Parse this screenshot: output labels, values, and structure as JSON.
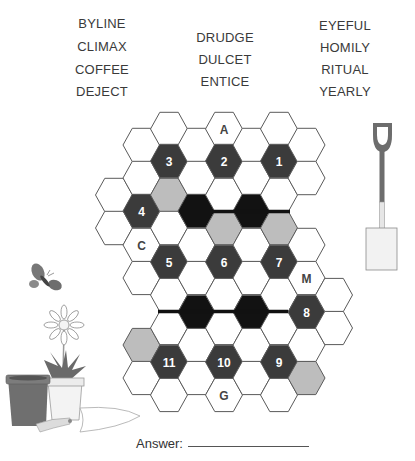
{
  "word_list": {
    "column_1": [
      "BYLINE",
      "CLIMAX",
      "COFFEE",
      "DEJECT"
    ],
    "column_2": [
      "DRUDGE",
      "DULCET",
      "ENTICE"
    ],
    "column_3": [
      "EYEFUL",
      "HOMILY",
      "RITUAL",
      "YEARLY"
    ]
  },
  "word_positions": {
    "column_1": {
      "x": 102,
      "y": [
        23,
        46,
        69,
        91
      ]
    },
    "column_2": {
      "x": 225,
      "y": [
        37,
        59,
        81
      ]
    },
    "column_3": {
      "x": 345,
      "y": [
        25,
        47,
        69,
        91
      ]
    }
  },
  "colors": {
    "numbered": "#3b3b3b",
    "blocked": "#121212",
    "shaded": "#bdbdbd",
    "empty": "#ffffff",
    "stroke": "#5a5a5a",
    "number_text": "#ffffff",
    "letter_text": "#444444"
  },
  "grid": {
    "column_x": [
      114,
      141.5,
      169,
      196.5,
      224,
      251.5,
      279,
      306.5,
      334
    ],
    "hex_radius": 18.5,
    "hex_height": 33.3,
    "cells": [
      {
        "c": 0,
        "y": 195,
        "type": "empty",
        "label": ""
      },
      {
        "c": 0,
        "y": 228,
        "type": "empty",
        "label": ""
      },
      {
        "c": 1,
        "y": 145,
        "type": "empty",
        "label": ""
      },
      {
        "c": 1,
        "y": 178,
        "type": "empty",
        "label": ""
      },
      {
        "c": 1,
        "y": 211,
        "type": "numbered",
        "label": "4"
      },
      {
        "c": 1,
        "y": 245,
        "type": "letter",
        "label": "C"
      },
      {
        "c": 1,
        "y": 278,
        "type": "empty",
        "label": ""
      },
      {
        "c": 1,
        "y": 345,
        "type": "shaded",
        "label": ""
      },
      {
        "c": 1,
        "y": 378,
        "type": "empty",
        "label": ""
      },
      {
        "c": 2,
        "y": 129,
        "type": "empty",
        "label": ""
      },
      {
        "c": 2,
        "y": 161,
        "type": "numbered",
        "label": "3"
      },
      {
        "c": 2,
        "y": 195,
        "type": "shaded",
        "label": ""
      },
      {
        "c": 2,
        "y": 228,
        "type": "empty",
        "label": ""
      },
      {
        "c": 2,
        "y": 262,
        "type": "numbered",
        "label": "5"
      },
      {
        "c": 2,
        "y": 295,
        "type": "empty",
        "label": ""
      },
      {
        "c": 2,
        "y": 328,
        "type": "empty",
        "label": ""
      },
      {
        "c": 2,
        "y": 362,
        "type": "numbered",
        "label": "11"
      },
      {
        "c": 2,
        "y": 395,
        "type": "empty",
        "label": ""
      },
      {
        "c": 3,
        "y": 145,
        "type": "empty",
        "label": ""
      },
      {
        "c": 3,
        "y": 178,
        "type": "empty",
        "label": ""
      },
      {
        "c": 3,
        "y": 211,
        "type": "blocked",
        "label": ""
      },
      {
        "c": 3,
        "y": 245,
        "type": "empty",
        "label": ""
      },
      {
        "c": 3,
        "y": 278,
        "type": "empty",
        "label": ""
      },
      {
        "c": 3,
        "y": 312,
        "type": "blocked",
        "label": ""
      },
      {
        "c": 3,
        "y": 345,
        "type": "empty",
        "label": ""
      },
      {
        "c": 3,
        "y": 378,
        "type": "empty",
        "label": ""
      },
      {
        "c": 4,
        "y": 129,
        "type": "letter",
        "label": "A"
      },
      {
        "c": 4,
        "y": 161,
        "type": "numbered",
        "label": "2"
      },
      {
        "c": 4,
        "y": 195,
        "type": "empty",
        "label": ""
      },
      {
        "c": 4,
        "y": 228,
        "type": "shaded",
        "label": ""
      },
      {
        "c": 4,
        "y": 262,
        "type": "numbered",
        "label": "6"
      },
      {
        "c": 4,
        "y": 295,
        "type": "empty",
        "label": ""
      },
      {
        "c": 4,
        "y": 328,
        "type": "empty",
        "label": ""
      },
      {
        "c": 4,
        "y": 362,
        "type": "numbered",
        "label": "10"
      },
      {
        "c": 4,
        "y": 395,
        "type": "letter",
        "label": "G"
      },
      {
        "c": 5,
        "y": 145,
        "type": "empty",
        "label": ""
      },
      {
        "c": 5,
        "y": 178,
        "type": "empty",
        "label": ""
      },
      {
        "c": 5,
        "y": 211,
        "type": "blocked",
        "label": ""
      },
      {
        "c": 5,
        "y": 245,
        "type": "empty",
        "label": ""
      },
      {
        "c": 5,
        "y": 278,
        "type": "empty",
        "label": ""
      },
      {
        "c": 5,
        "y": 312,
        "type": "blocked",
        "label": ""
      },
      {
        "c": 5,
        "y": 345,
        "type": "empty",
        "label": ""
      },
      {
        "c": 5,
        "y": 378,
        "type": "empty",
        "label": ""
      },
      {
        "c": 6,
        "y": 129,
        "type": "empty",
        "label": ""
      },
      {
        "c": 6,
        "y": 161,
        "type": "numbered",
        "label": "1"
      },
      {
        "c": 6,
        "y": 195,
        "type": "empty",
        "label": ""
      },
      {
        "c": 6,
        "y": 228,
        "type": "shaded",
        "label": ""
      },
      {
        "c": 6,
        "y": 262,
        "type": "numbered",
        "label": "7"
      },
      {
        "c": 6,
        "y": 295,
        "type": "empty",
        "label": ""
      },
      {
        "c": 6,
        "y": 328,
        "type": "empty",
        "label": ""
      },
      {
        "c": 6,
        "y": 362,
        "type": "numbered",
        "label": "9"
      },
      {
        "c": 6,
        "y": 395,
        "type": "empty",
        "label": ""
      },
      {
        "c": 7,
        "y": 145,
        "type": "empty",
        "label": ""
      },
      {
        "c": 7,
        "y": 178,
        "type": "empty",
        "label": ""
      },
      {
        "c": 7,
        "y": 245,
        "type": "empty",
        "label": ""
      },
      {
        "c": 7,
        "y": 278,
        "type": "letter",
        "label": "M"
      },
      {
        "c": 7,
        "y": 312,
        "type": "numbered",
        "label": "8"
      },
      {
        "c": 7,
        "y": 345,
        "type": "empty",
        "label": ""
      },
      {
        "c": 7,
        "y": 378,
        "type": "shaded",
        "label": ""
      },
      {
        "c": 8,
        "y": 295,
        "type": "empty",
        "label": ""
      },
      {
        "c": 8,
        "y": 328,
        "type": "empty",
        "label": ""
      }
    ],
    "thick_walls": [
      {
        "x1": 212,
        "y1": 211.5,
        "x2": 290,
        "y2": 211.5
      },
      {
        "x1": 158,
        "y1": 311.5,
        "x2": 288,
        "y2": 311.5
      }
    ]
  },
  "answer": {
    "label": "Answer:",
    "value": ""
  }
}
